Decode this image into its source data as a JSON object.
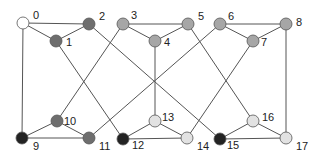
{
  "diagram": {
    "type": "graph",
    "colors": {
      "white": "#ffffff",
      "light": "#e2e2e2",
      "gray": "#a6a6a6",
      "dark": "#6e6e6e",
      "black": "#232323",
      "edge": "#555555"
    },
    "nodes": [
      {
        "id": "0",
        "label": "0",
        "x": 23,
        "y": 23,
        "fill": "white",
        "lx": 10,
        "ly": -4
      },
      {
        "id": "1",
        "label": "1",
        "x": 56,
        "y": 41,
        "fill": "dark",
        "lx": 10,
        "ly": 5
      },
      {
        "id": "2",
        "label": "2",
        "x": 89,
        "y": 24,
        "fill": "dark",
        "lx": 10,
        "ly": -4
      },
      {
        "id": "3",
        "label": "3",
        "x": 123,
        "y": 24,
        "fill": "gray",
        "lx": 8,
        "ly": -5
      },
      {
        "id": "4",
        "label": "4",
        "x": 155,
        "y": 41,
        "fill": "gray",
        "lx": 9,
        "ly": 5
      },
      {
        "id": "5",
        "label": "5",
        "x": 188,
        "y": 24,
        "fill": "gray",
        "lx": 10,
        "ly": -4
      },
      {
        "id": "6",
        "label": "6",
        "x": 220,
        "y": 24,
        "fill": "gray",
        "lx": 8,
        "ly": -4
      },
      {
        "id": "7",
        "label": "7",
        "x": 253,
        "y": 41,
        "fill": "gray",
        "lx": 8,
        "ly": 5
      },
      {
        "id": "8",
        "label": "8",
        "x": 286,
        "y": 24,
        "fill": "gray",
        "lx": 10,
        "ly": 2
      },
      {
        "id": "9",
        "label": "9",
        "x": 22,
        "y": 138,
        "fill": "black",
        "lx": 11,
        "ly": 12
      },
      {
        "id": "10",
        "label": "10",
        "x": 57,
        "y": 121,
        "fill": "dark",
        "lx": 7,
        "ly": 4
      },
      {
        "id": "11",
        "label": "11",
        "x": 89,
        "y": 138,
        "fill": "dark",
        "lx": 10,
        "ly": 12
      },
      {
        "id": "12",
        "label": "12",
        "x": 123,
        "y": 139,
        "fill": "black",
        "lx": 9,
        "ly": 10
      },
      {
        "id": "13",
        "label": "13",
        "x": 155,
        "y": 121,
        "fill": "light",
        "lx": 7,
        "ly": 0
      },
      {
        "id": "14",
        "label": "14",
        "x": 187,
        "y": 138,
        "fill": "light",
        "lx": 10,
        "ly": 12
      },
      {
        "id": "15",
        "label": "15",
        "x": 220,
        "y": 139,
        "fill": "black",
        "lx": 7,
        "ly": 10
      },
      {
        "id": "16",
        "label": "16",
        "x": 253,
        "y": 121,
        "fill": "light",
        "lx": 9,
        "ly": 0
      },
      {
        "id": "17",
        "label": "17",
        "x": 286,
        "y": 138,
        "fill": "light",
        "lx": 10,
        "ly": 12
      }
    ],
    "edges": [
      [
        "0",
        "2"
      ],
      [
        "0",
        "1"
      ],
      [
        "1",
        "2"
      ],
      [
        "0",
        "9"
      ],
      [
        "3",
        "5"
      ],
      [
        "3",
        "4"
      ],
      [
        "4",
        "5"
      ],
      [
        "6",
        "8"
      ],
      [
        "6",
        "7"
      ],
      [
        "7",
        "8"
      ],
      [
        "8",
        "17"
      ],
      [
        "9",
        "10"
      ],
      [
        "10",
        "11"
      ],
      [
        "9",
        "11"
      ],
      [
        "12",
        "13"
      ],
      [
        "13",
        "14"
      ],
      [
        "12",
        "14"
      ],
      [
        "15",
        "16"
      ],
      [
        "16",
        "17"
      ],
      [
        "15",
        "17"
      ],
      [
        "1",
        "12"
      ],
      [
        "2",
        "15"
      ],
      [
        "3",
        "10"
      ],
      [
        "4",
        "13"
      ],
      [
        "5",
        "16"
      ],
      [
        "6",
        "11"
      ],
      [
        "7",
        "14"
      ]
    ],
    "node_radius": 6
  }
}
